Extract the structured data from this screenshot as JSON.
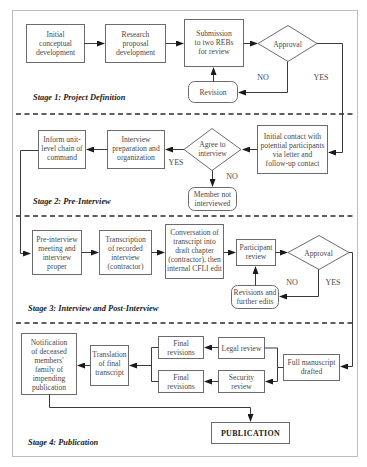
{
  "stages": {
    "s1": "Stage 1: Project Definition",
    "s2": "Stage 2: Pre-Interview",
    "s3": "Stage 3: Interview and Post-Interview",
    "s4": "Stage 4: Publication"
  },
  "nodes": {
    "initial_dev": [
      "Initial",
      "conceptual",
      "development"
    ],
    "research_prop": [
      "Research",
      "proposal",
      "development"
    ],
    "submission": [
      "Submission",
      "to two REBs",
      "for review"
    ],
    "approval1": [
      "Approval"
    ],
    "revision": [
      "Revision"
    ],
    "initial_contact": [
      "Initial contact with",
      "potential participants",
      "via letter and",
      "follow-up contact"
    ],
    "agree": [
      "Agree to",
      "interview"
    ],
    "member_not": [
      "Member not",
      "interviewed"
    ],
    "interview_prep": [
      "Interview",
      "preparation and",
      "organization"
    ],
    "inform_unit": [
      "Inform unit-",
      "level chain of",
      "command"
    ],
    "pre_interview": [
      "Pre-interview",
      "meeting and",
      "interview",
      "proper"
    ],
    "transcription": [
      "Transcription",
      "of recorded",
      "interview",
      "(contractor)"
    ],
    "conversation": [
      "Conversation of",
      "transcript into",
      "draft chapter",
      "(contractor), then",
      "internal CFLI edit"
    ],
    "participant_review": [
      "Participant",
      "review"
    ],
    "approval2": [
      "Approval"
    ],
    "revisions_edits": [
      "Revisions and",
      "further edits"
    ],
    "full_manuscript": [
      "Full manuscript",
      "drafted"
    ],
    "legal_review": [
      "Legal review"
    ],
    "security_review": [
      "Security",
      "review"
    ],
    "final_rev1": [
      "Final",
      "revisions"
    ],
    "final_rev2": [
      "Final",
      "revisions"
    ],
    "translation": [
      "Translation",
      "of final",
      "transcript"
    ],
    "notification": [
      "Notification",
      "of deceased",
      "members'",
      "family of",
      "impending",
      "publication"
    ],
    "publication": [
      "PUBLICATION"
    ]
  },
  "labels": {
    "no1": "NO",
    "yes1": "YES",
    "yes2": "YES",
    "no2": "NO",
    "no3": "NO",
    "yes3": "YES"
  },
  "colors": {
    "box_stroke": "#6b6b6b",
    "line": "#3a3a3a",
    "text": "#4a4a4a",
    "frame": "#bdbdbd"
  }
}
